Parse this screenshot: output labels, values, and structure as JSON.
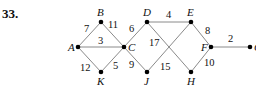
{
  "problem_number": "33.",
  "graph": {
    "nodes": [
      {
        "id": "A",
        "x": 78,
        "y": 47,
        "label_dx": -10,
        "label_dy": 4
      },
      {
        "id": "B",
        "x": 101,
        "y": 22,
        "label_dx": -4,
        "label_dy": -6
      },
      {
        "id": "C",
        "x": 124,
        "y": 47,
        "label_dx": 4,
        "label_dy": 4
      },
      {
        "id": "K",
        "x": 101,
        "y": 72,
        "label_dx": -4,
        "label_dy": 13
      },
      {
        "id": "D",
        "x": 147,
        "y": 22,
        "label_dx": -4,
        "label_dy": -6
      },
      {
        "id": "E",
        "x": 191,
        "y": 22,
        "label_dx": -4,
        "label_dy": -6
      },
      {
        "id": "J",
        "x": 147,
        "y": 72,
        "label_dx": -3,
        "label_dy": 13
      },
      {
        "id": "H",
        "x": 191,
        "y": 72,
        "label_dx": -4,
        "label_dy": 13
      },
      {
        "id": "F",
        "x": 211,
        "y": 47,
        "label_dx": -10,
        "label_dy": 4
      },
      {
        "id": "G",
        "x": 250,
        "y": 47,
        "label_dx": 4,
        "label_dy": 4
      }
    ],
    "edges": [
      {
        "from": "A",
        "to": "B",
        "weight": "7",
        "lx": 84,
        "ly": 32
      },
      {
        "from": "B",
        "to": "C",
        "weight": "11",
        "lx": 108,
        "ly": 28
      },
      {
        "from": "A",
        "to": "C",
        "weight": "3",
        "lx": 98,
        "ly": 44
      },
      {
        "from": "A",
        "to": "K",
        "weight": "12",
        "lx": 80,
        "ly": 71
      },
      {
        "from": "K",
        "to": "C",
        "weight": "5",
        "lx": 113,
        "ly": 69
      },
      {
        "from": "C",
        "to": "D",
        "weight": "6",
        "lx": 129,
        "ly": 32
      },
      {
        "from": "C",
        "to": "J",
        "weight": "9",
        "lx": 129,
        "ly": 68
      },
      {
        "from": "D",
        "to": "E",
        "weight": "4",
        "lx": 166,
        "ly": 18
      },
      {
        "from": "D",
        "to": "H",
        "weight": "17",
        "lx": 149,
        "ly": 46
      },
      {
        "from": "J",
        "to": "E",
        "weight": "15",
        "lx": 160,
        "ly": 70
      },
      {
        "from": "E",
        "to": "F",
        "weight": "8",
        "lx": 205,
        "ly": 34
      },
      {
        "from": "H",
        "to": "F",
        "weight": "10",
        "lx": 204,
        "ly": 66
      },
      {
        "from": "F",
        "to": "G",
        "weight": "2",
        "lx": 228,
        "ly": 42
      }
    ]
  }
}
